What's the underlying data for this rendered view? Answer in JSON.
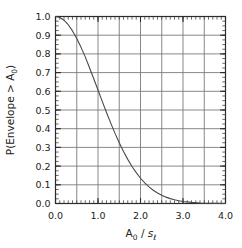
{
  "chart_data": {
    "type": "line",
    "title": "",
    "subtitle": "",
    "xlabel": "A_0 / s_l",
    "xlabel_parts": {
      "base1": "A",
      "sub1": "0",
      "separator": " / ",
      "base2": "s",
      "sub2": "ℓ"
    },
    "ylabel": "P(Envelope > A_0)",
    "ylabel_parts": {
      "prefix": "P(Envelope > A",
      "sub": "0",
      "suffix": ")"
    },
    "xlim": [
      0.0,
      4.0
    ],
    "ylim": [
      0.0,
      1.0
    ],
    "xticks_major": [
      "0.0",
      "1.0",
      "2.0",
      "3.0",
      "4.0"
    ],
    "xticks_major_values": [
      0.0,
      1.0,
      2.0,
      3.0,
      4.0
    ],
    "xgrid_values": [
      0.5,
      1.0,
      1.5,
      2.0,
      2.5,
      3.0,
      3.5
    ],
    "xminor_step": 0.1,
    "yticks_major": [
      "0.0",
      "0.1",
      "0.2",
      "0.3",
      "0.4",
      "0.5",
      "0.6",
      "0.7",
      "0.8",
      "0.9",
      "1.0"
    ],
    "yticks_major_values": [
      0.0,
      0.1,
      0.2,
      0.3,
      0.4,
      0.5,
      0.6,
      0.7,
      0.8,
      0.9,
      1.0
    ],
    "ygrid_values": [
      0.1,
      0.2,
      0.3,
      0.4,
      0.5,
      0.6,
      0.7,
      0.8,
      0.9
    ],
    "yminor_step": 0.025,
    "grid": true,
    "legend": "none",
    "line_color": "#4a4a4a",
    "grid_color": "#7a7a7a",
    "frame_color": "#2b2b2b",
    "series": [
      {
        "name": "P(Envelope > A0) = exp(-x^2/2)",
        "x": [
          0.0,
          0.1,
          0.2,
          0.3,
          0.4,
          0.5,
          0.6,
          0.7,
          0.8,
          0.9,
          1.0,
          1.1,
          1.2,
          1.3,
          1.4,
          1.5,
          1.6,
          1.7,
          1.8,
          1.9,
          2.0,
          2.1,
          2.2,
          2.3,
          2.4,
          2.5,
          2.6,
          2.7,
          2.8,
          2.9,
          3.0,
          3.2,
          3.4,
          3.6,
          3.8,
          4.0
        ],
        "y": [
          1.0,
          0.995,
          0.98,
          0.956,
          0.923,
          0.882,
          0.835,
          0.784,
          0.726,
          0.667,
          0.607,
          0.546,
          0.487,
          0.43,
          0.375,
          0.325,
          0.278,
          0.236,
          0.198,
          0.165,
          0.135,
          0.11,
          0.089,
          0.071,
          0.056,
          0.044,
          0.034,
          0.026,
          0.02,
          0.015,
          0.011,
          0.006,
          0.003,
          0.0015,
          0.0007,
          0.0003
        ]
      }
    ],
    "annotations": []
  },
  "axes": {
    "x_axis_name": "x-axis",
    "y_axis_name": "y-axis"
  }
}
